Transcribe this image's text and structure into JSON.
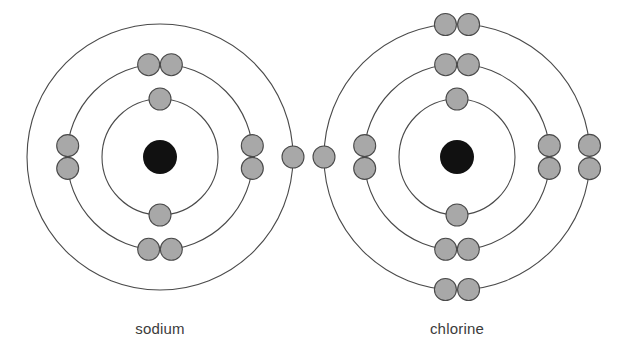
{
  "figure": {
    "background_color": "#ffffff",
    "width": 617,
    "height": 362
  },
  "style": {
    "shell_stroke_color": "#4a4a4a",
    "shell_stroke_width": 1.1,
    "electron_fill_color": "#a8a8a8",
    "electron_stroke_color": "#4a4a4a",
    "nucleus_fill_color": "#111111",
    "label_color": "#3b3b3b",
    "label_font_size": 15,
    "electron_radius": 11,
    "nucleus_radius": 17
  },
  "atoms": [
    {
      "id": "sodium",
      "label": "sodium",
      "element_symbol": "Na",
      "atomic_number": 11,
      "center_x": 160,
      "center_y": 157,
      "label_x": 160,
      "label_y": 330,
      "nucleus": {
        "radius": 17,
        "color": "#111111"
      },
      "shells": [
        {
          "name": "shell-1",
          "radius": 58,
          "electron_count": 2,
          "electron_angles_deg": [
            270,
            90
          ]
        },
        {
          "name": "shell-2",
          "radius": 93,
          "electron_count": 8,
          "electron_angles_deg": [
            263,
            277,
            173,
            187,
            353,
            7,
            83,
            97
          ]
        },
        {
          "name": "shell-3",
          "radius": 133,
          "electron_count": 1,
          "electron_angles_deg": [
            0
          ]
        }
      ],
      "electron_configuration": "2, 8, 1",
      "total_electrons": 11
    },
    {
      "id": "chlorine",
      "label": "chlorine",
      "element_symbol": "Cl",
      "atomic_number": 17,
      "center_x": 457,
      "center_y": 157,
      "label_x": 457,
      "label_y": 330,
      "nucleus": {
        "radius": 17,
        "color": "#111111"
      },
      "shells": [
        {
          "name": "shell-1",
          "radius": 58,
          "electron_count": 2,
          "electron_angles_deg": [
            270,
            90
          ]
        },
        {
          "name": "shell-2",
          "radius": 93,
          "electron_count": 8,
          "electron_angles_deg": [
            263,
            277,
            173,
            187,
            353,
            7,
            83,
            97
          ]
        },
        {
          "name": "shell-3",
          "radius": 133,
          "electron_count": 7,
          "electron_angles_deg": [
            265,
            275,
            180,
            355,
            5,
            85,
            95
          ]
        }
      ],
      "electron_configuration": "2, 8, 7",
      "total_electrons": 17
    }
  ]
}
